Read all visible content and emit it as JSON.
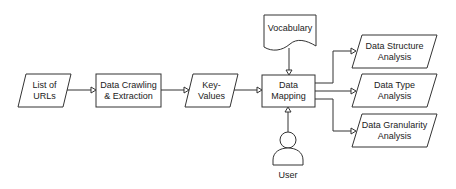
{
  "diagram": {
    "nodes": {
      "list_of_urls": {
        "label": "List of\nURLs",
        "shape": "parallelogram"
      },
      "data_crawling": {
        "label": "Data Crawling\n& Extraction",
        "shape": "rectangle"
      },
      "key_values": {
        "label": "Key-\nValues",
        "shape": "parallelogram"
      },
      "data_mapping": {
        "label": "Data\nMapping",
        "shape": "rectangle"
      },
      "vocabulary": {
        "label": "Vocabulary",
        "shape": "document"
      },
      "user": {
        "label": "User",
        "shape": "actor"
      },
      "data_structure": {
        "label": "Data Structure\nAnalysis",
        "shape": "parallelogram"
      },
      "data_type": {
        "label": "Data Type\nAnalysis",
        "shape": "parallelogram"
      },
      "data_granularity": {
        "label": "Data Granularity\nAnalysis",
        "shape": "parallelogram"
      }
    },
    "edges": [
      {
        "from": "List of URLs",
        "to": "Data Crawling & Extraction"
      },
      {
        "from": "Data Crawling & Extraction",
        "to": "Key-Values"
      },
      {
        "from": "Key-Values",
        "to": "Data Mapping"
      },
      {
        "from": "Vocabulary",
        "to": "Data Mapping"
      },
      {
        "from": "User",
        "to": "Data Mapping"
      },
      {
        "from": "Data Mapping",
        "to": "Data Structure Analysis"
      },
      {
        "from": "Data Mapping",
        "to": "Data Type Analysis"
      },
      {
        "from": "Data Mapping",
        "to": "Data Granularity Analysis"
      }
    ],
    "colors": {
      "stroke": "#333333",
      "fill": "#ffffff",
      "text": "#222222"
    }
  }
}
